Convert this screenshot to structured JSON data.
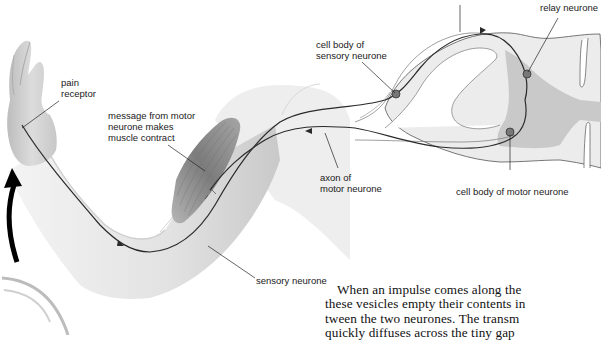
{
  "figure": {
    "labels": {
      "pain_receptor": [
        "pain",
        "receptor"
      ],
      "message_motor": [
        "message from motor",
        "neurone makes",
        "muscle contract"
      ],
      "cell_body_sensory": [
        "cell body of",
        "sensory neurone"
      ],
      "relay_neurone": "relay neurone",
      "axon_motor": [
        "axon of",
        "motor neurone"
      ],
      "cell_body_motor": "cell body of motor neurone",
      "sensory_neurone": "sensory neurone"
    },
    "colors": {
      "skin": "#e6e6e6",
      "skin_shadow": "#bdbdbd",
      "muscle": "#8a8a8a",
      "grey_matter": "#c8c8c8",
      "white_matter": "#ececec",
      "nerve": "#2a2a2a",
      "arrow": "#000000"
    }
  },
  "body_text": {
    "lines": [
      "When an impulse comes along the",
      "these vesicles empty their contents in",
      "tween the two neurones. The transm",
      "quickly diffuses across the tiny gap"
    ]
  }
}
